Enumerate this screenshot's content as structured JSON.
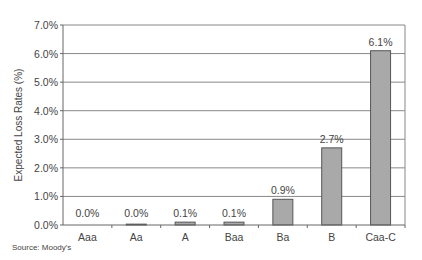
{
  "chart_data": {
    "type": "bar",
    "title": "",
    "xlabel": "",
    "ylabel": "Expected Loss Rates (%)",
    "categories": [
      "Aaa",
      "Aa",
      "A",
      "Baa",
      "Ba",
      "B",
      "Caa-C"
    ],
    "values": [
      0.0,
      0.03,
      0.1,
      0.1,
      0.9,
      2.7,
      6.1
    ],
    "data_labels": [
      "0.0%",
      "0.0%",
      "0.1%",
      "0.1%",
      "0.9%",
      "2.7%",
      "6.1%"
    ],
    "ylim": [
      0,
      7
    ],
    "yticks": [
      0,
      1,
      2,
      3,
      4,
      5,
      6,
      7
    ],
    "ytick_labels": [
      "0.0%",
      "1.0%",
      "2.0%",
      "3.0%",
      "4.0%",
      "5.0%",
      "6.0%",
      "7.0%"
    ],
    "grid": true,
    "legend": null,
    "colors": {
      "bar_fill": "#a9a9a9",
      "bar_stroke": "#555555",
      "grid": "#888888",
      "axis": "#666666"
    }
  },
  "source_note": "Source: Moody's"
}
